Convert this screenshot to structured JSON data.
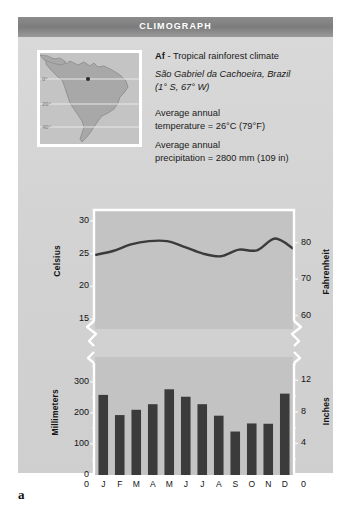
{
  "figure": {
    "letter": "a",
    "banner_title": "CLIMOGRAPH"
  },
  "info": {
    "code": "Af",
    "code_suffix": " - Tropical rainforest climate",
    "location": "São Gabriel da Cachoeira, Brazil",
    "coordinates": "(1° S, 67° W)",
    "temp_line1": "Average annual",
    "temp_line2": "temperature = 26°C (79°F)",
    "precip_line1": "Average annual",
    "precip_line2": "precipitation = 2800 mm (109 in)"
  },
  "map": {
    "region": "South America",
    "latitude_labels": [
      "0°",
      "20°",
      "40°"
    ],
    "marker_label": "site-marker"
  },
  "chart_data": [
    {
      "type": "line",
      "title": "Temperature",
      "categories": [
        "J",
        "F",
        "M",
        "A",
        "M",
        "J",
        "J",
        "A",
        "S",
        "O",
        "N",
        "D"
      ],
      "values": [
        24.8,
        25.4,
        26.4,
        26.9,
        26.9,
        26.0,
        25.0,
        24.6,
        25.6,
        25.5,
        27.3,
        25.8
      ],
      "ylabel": "Celsius",
      "y2label": "Fahrenheit",
      "yticks": [
        15,
        20,
        25,
        30
      ],
      "y2ticks": [
        60,
        70,
        80
      ],
      "ylim": [
        13.5,
        31.5
      ],
      "y2lim": [
        56.3,
        88.7
      ],
      "grid": false,
      "axis_break": true,
      "line_color": "#3b3b3b"
    },
    {
      "type": "bar",
      "title": "Precipitation",
      "categories": [
        "J",
        "F",
        "M",
        "A",
        "M",
        "J",
        "J",
        "A",
        "S",
        "O",
        "N",
        "D"
      ],
      "values": [
        258,
        193,
        210,
        228,
        276,
        252,
        228,
        191,
        140,
        166,
        165,
        262
      ],
      "ylabel": "Millimeters",
      "y2label": "Inches",
      "yticks": [
        0,
        100,
        200,
        300
      ],
      "y2ticks": [
        0,
        4,
        8,
        12
      ],
      "ylim": [
        0,
        380
      ],
      "y2lim": [
        0,
        14.96
      ],
      "minor_tick_step": 50,
      "grid": false,
      "axis_break": true,
      "bar_color": "#3b3b3b"
    }
  ],
  "axis_zero_labels": {
    "left": "0",
    "right": "0"
  }
}
